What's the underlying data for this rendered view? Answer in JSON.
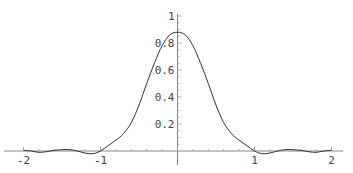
{
  "chart_data": {
    "type": "line",
    "title": "",
    "xlabel": "",
    "ylabel": "",
    "xlim": [
      -2.05,
      2.05
    ],
    "ylim": [
      -0.04,
      1.0
    ],
    "grid": false,
    "legend": null,
    "x_ticks": [
      {
        "value": -2,
        "label": "-2"
      },
      {
        "value": -1,
        "label": "-1"
      },
      {
        "value": 1,
        "label": "1"
      },
      {
        "value": 2,
        "label": "2"
      }
    ],
    "y_ticks": [
      {
        "value": 0.2,
        "label": "0.2"
      },
      {
        "value": 0.4,
        "label": "0.4"
      },
      {
        "value": 0.6,
        "label": "0.6"
      },
      {
        "value": 0.8,
        "label": "0.8"
      },
      {
        "value": 1.0,
        "label": "1"
      }
    ],
    "series": [
      {
        "name": "curve",
        "color": "#333333",
        "x": [
          -2.0,
          -1.9,
          -1.8,
          -1.7,
          -1.6,
          -1.5,
          -1.4,
          -1.3,
          -1.2,
          -1.1,
          -1.0,
          -0.9,
          -0.8,
          -0.7,
          -0.6,
          -0.5,
          -0.4,
          -0.3,
          -0.2,
          -0.1,
          0.0,
          0.1,
          0.2,
          0.3,
          0.4,
          0.5,
          0.6,
          0.7,
          0.8,
          0.9,
          1.0,
          1.1,
          1.2,
          1.3,
          1.4,
          1.5,
          1.6,
          1.7,
          1.8,
          1.9,
          2.0
        ],
        "y": [
          0.005,
          0.0,
          -0.01,
          -0.005,
          0.005,
          0.01,
          0.01,
          0.0,
          -0.015,
          -0.02,
          0.0,
          0.04,
          0.08,
          0.13,
          0.21,
          0.34,
          0.5,
          0.65,
          0.78,
          0.86,
          0.88,
          0.86,
          0.78,
          0.65,
          0.5,
          0.34,
          0.21,
          0.13,
          0.08,
          0.04,
          0.0,
          -0.02,
          -0.015,
          0.0,
          0.01,
          0.01,
          0.005,
          -0.005,
          -0.01,
          0.0,
          0.005
        ]
      }
    ]
  }
}
